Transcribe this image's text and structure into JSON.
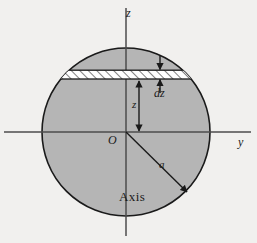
{
  "figure": {
    "kind": "cross-section-diagram",
    "width": 257,
    "height": 243,
    "background_color": "#f1f0ee"
  },
  "colors": {
    "sphere_fill": "#b5b5b5",
    "sphere_stroke": "#1a1a1a",
    "axis_stroke": "#4d4d4d",
    "slab_fill": "#ffffff",
    "slab_stroke": "#1a1a1a",
    "hatch_stroke": "#1a1a1a",
    "arrow_stroke": "#1a1a1a",
    "text_color": "#1a1a1a"
  },
  "geometry": {
    "sphere": {
      "center_x": 126,
      "center_y": 132,
      "radius": 84
    },
    "z_axis": {
      "x": 126,
      "y_top": 8,
      "y_bottom": 236
    },
    "y_axis": {
      "y": 132,
      "x_left": 4,
      "x_right": 251
    },
    "slab": {
      "y_top": 70,
      "y_bottom": 79,
      "x_left": 64,
      "x_right": 188
    },
    "dz_arrow_x": 160,
    "z_arrow_x": 139,
    "radius_arrow": {
      "x1": 126,
      "y1": 132,
      "x2": 188,
      "y2": 193
    }
  },
  "labels": {
    "z_axis": "z",
    "y_axis": "y",
    "origin": "O",
    "slab_thickness": "dz",
    "slab_height": "z",
    "sphere_radius": "a",
    "axis_caption": "Axis"
  }
}
